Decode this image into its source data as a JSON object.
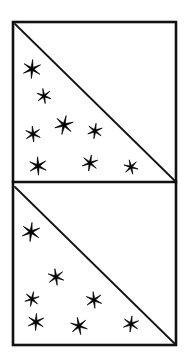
{
  "figure": {
    "title": "Two stacked square panels each divided by a diagonal with star marks in the lower-left triangle",
    "kind": "line-drawing",
    "background_color": "#ffffff",
    "ink_color": "#000000",
    "canvas": {
      "width": 189,
      "height": 360
    },
    "frame": {
      "name": "outer-rectangle",
      "left": 13,
      "top": 22,
      "right": 176,
      "bottom": 345,
      "stroke_width": 2.6,
      "color": "#111111"
    },
    "divider": {
      "name": "horizontal-divider",
      "x1": 13,
      "y1": 182,
      "x2": 176,
      "y2": 182,
      "stroke_width": 2.4,
      "color": "#111111"
    },
    "panels": [
      {
        "name": "top-panel",
        "label": "Top panel",
        "left": 13,
        "top": 22,
        "right": 176,
        "bottom": 182,
        "diagonal": {
          "x1": 15,
          "y1": 24,
          "x2": 175,
          "y2": 181,
          "stroke_width": 1.8
        },
        "star_count": 8,
        "stars": [
          {
            "id": "t1",
            "cx": 32,
            "cy": 69,
            "r": 9.5,
            "rotation": 4
          },
          {
            "id": "t2",
            "cx": 44,
            "cy": 96,
            "r": 7.6,
            "rotation": -9
          },
          {
            "id": "t3",
            "cx": 64,
            "cy": 125,
            "r": 9.6,
            "rotation": 13
          },
          {
            "id": "t4",
            "cx": 33,
            "cy": 134,
            "r": 8.0,
            "rotation": -5
          },
          {
            "id": "t5",
            "cx": 95,
            "cy": 131,
            "r": 7.8,
            "rotation": 8
          },
          {
            "id": "t6",
            "cx": 38,
            "cy": 166,
            "r": 9.2,
            "rotation": -3
          },
          {
            "id": "t7",
            "cx": 90,
            "cy": 163,
            "r": 8.2,
            "rotation": 10
          },
          {
            "id": "t8",
            "cx": 131,
            "cy": 167,
            "r": 7.4,
            "rotation": -14
          }
        ]
      },
      {
        "name": "bottom-panel",
        "label": "Bottom panel",
        "left": 13,
        "top": 185,
        "right": 176,
        "bottom": 345,
        "diagonal": {
          "x1": 15,
          "y1": 187,
          "x2": 175,
          "y2": 344,
          "stroke_width": 1.8
        },
        "star_count": 7,
        "stars": [
          {
            "id": "b1",
            "cx": 31,
            "cy": 232,
            "r": 9.6,
            "rotation": 6
          },
          {
            "id": "b2",
            "cx": 56,
            "cy": 277,
            "r": 8.4,
            "rotation": -8
          },
          {
            "id": "b3",
            "cx": 32,
            "cy": 299,
            "r": 7.5,
            "rotation": 12
          },
          {
            "id": "b4",
            "cx": 94,
            "cy": 300,
            "r": 8.4,
            "rotation": -6
          },
          {
            "id": "b5",
            "cx": 36,
            "cy": 322,
            "r": 8.6,
            "rotation": 3
          },
          {
            "id": "b6",
            "cx": 79,
            "cy": 326,
            "r": 8.8,
            "rotation": -11
          },
          {
            "id": "b7",
            "cx": 131,
            "cy": 324,
            "r": 8.2,
            "rotation": 7
          }
        ]
      }
    ],
    "star_glyph": {
      "name": "six-pointed-asterisk-star",
      "points": 6,
      "inner_ratio": 0.2
    }
  }
}
